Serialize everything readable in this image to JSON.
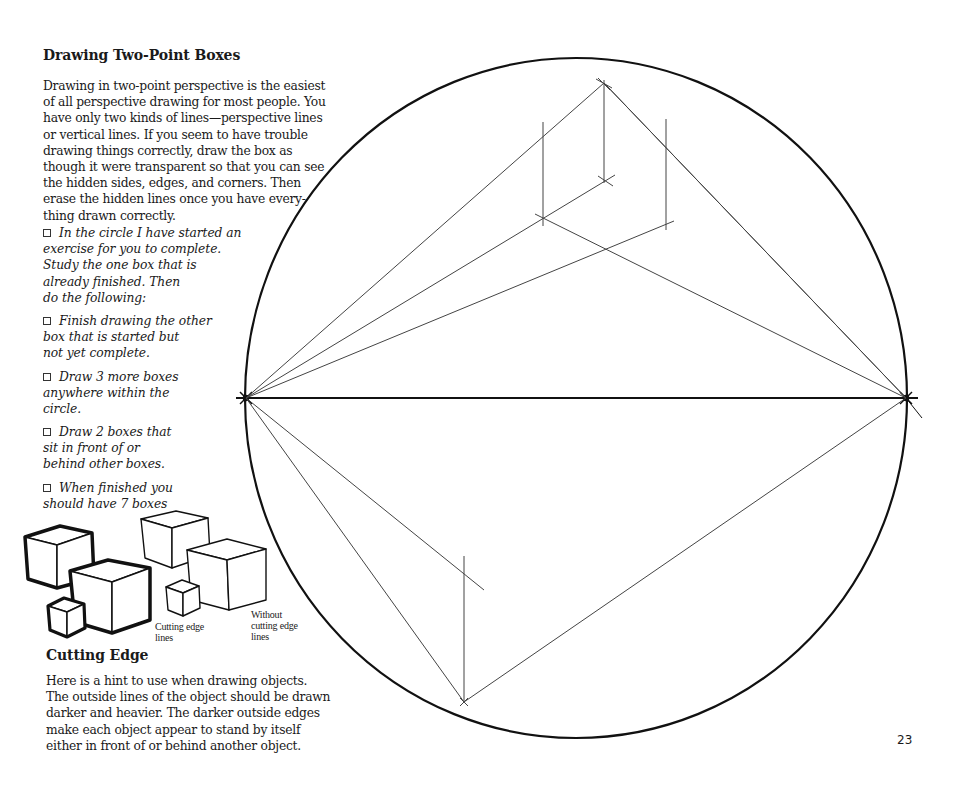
{
  "section1": {
    "title": "Drawing Two-Point Boxes",
    "paragraph_lines": [
      "Drawing in two-point perspective is the easiest",
      "of all perspective drawing for most people. You",
      "have only two kinds of lines—perspective lines",
      "or vertical lines. If you seem to have trouble",
      "drawing things correctly, draw the box as",
      "though it were transparent so that you can see",
      "the hidden sides, edges, and corners. Then",
      "erase the hidden lines once you have every-",
      "thing drawn correctly."
    ]
  },
  "tasks": [
    {
      "lines": [
        "In the circle I have started an",
        "exercise for you to complete.",
        "Study the one box that is",
        "already finished. Then",
        "do the following:"
      ]
    },
    {
      "lines": [
        "Finish drawing the other",
        "box that is started but",
        "not yet complete."
      ]
    },
    {
      "lines": [
        "Draw 3 more boxes",
        "anywhere within the",
        "circle."
      ]
    },
    {
      "lines": [
        "Draw 2 boxes that",
        "sit in front of or",
        "behind other boxes."
      ]
    },
    {
      "lines": [
        "When finished you",
        "should have 7 boxes"
      ]
    }
  ],
  "illustration": {
    "caption_with": [
      "Cutting edge",
      "lines"
    ],
    "caption_without": [
      "Without",
      "cutting edge",
      "lines"
    ]
  },
  "section2": {
    "title": "Cutting Edge",
    "paragraph_lines": [
      "Here is a hint to use when drawing objects.",
      "The outside lines of the object should be drawn",
      "darker and heavier. The darker outside edges",
      "make each object appear to stand by itself",
      "either in front of or behind another object."
    ]
  },
  "page_number": "23",
  "colors": {
    "ink": "#1a1a1a",
    "construction_line": "#444444",
    "paper": "#ffffff"
  }
}
